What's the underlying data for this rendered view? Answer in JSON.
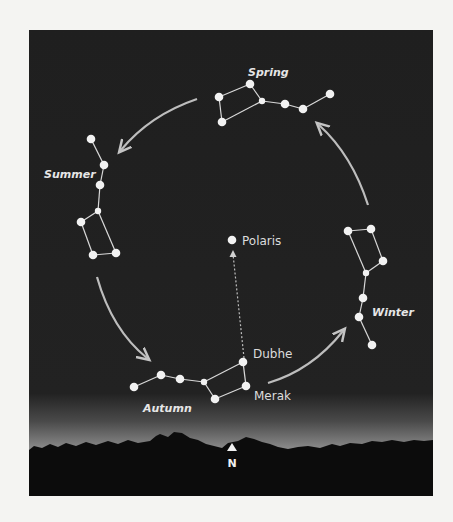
{
  "diagram": {
    "colors": {
      "page": "#f4f4f2",
      "sky": "#1f1f1f",
      "horizon_glow": "#8a8a8a",
      "trees": "#0c0c0c",
      "star": "#f2f2f2",
      "line": "#d8d8d8",
      "arrow": "#bdbdbd"
    },
    "seasons": [
      {
        "name": "Spring",
        "label": "Spring",
        "label_pos": [
          248,
          76
        ],
        "stars": [
          [
            219,
            97
          ],
          [
            250,
            84
          ],
          [
            262,
            101
          ],
          [
            285,
            104
          ],
          [
            303,
            109
          ],
          [
            330,
            94
          ],
          [
            222,
            122
          ]
        ],
        "lines": [
          [
            0,
            1
          ],
          [
            1,
            2
          ],
          [
            2,
            6
          ],
          [
            6,
            0
          ],
          [
            2,
            3
          ],
          [
            3,
            4
          ],
          [
            4,
            5
          ]
        ]
      },
      {
        "name": "Summer",
        "label": "Summer",
        "label_pos": [
          44,
          178
        ],
        "stars": [
          [
            91,
            139
          ],
          [
            104,
            165
          ],
          [
            100,
            185
          ],
          [
            98,
            211
          ],
          [
            81,
            222
          ],
          [
            93,
            255
          ],
          [
            116,
            253
          ]
        ],
        "lines": [
          [
            0,
            1
          ],
          [
            1,
            2
          ],
          [
            2,
            3
          ],
          [
            3,
            4
          ],
          [
            4,
            5
          ],
          [
            5,
            6
          ],
          [
            6,
            3
          ]
        ]
      },
      {
        "name": "Autumn",
        "label": "Autumn",
        "label_pos": [
          143,
          412
        ],
        "stars": [
          [
            134,
            387
          ],
          [
            161,
            375
          ],
          [
            180,
            379
          ],
          [
            204,
            382
          ],
          [
            215,
            399
          ],
          [
            243,
            362
          ],
          [
            246,
            386
          ]
        ],
        "lines": [
          [
            0,
            1
          ],
          [
            1,
            2
          ],
          [
            2,
            3
          ],
          [
            3,
            5
          ],
          [
            5,
            6
          ],
          [
            6,
            4
          ],
          [
            4,
            3
          ]
        ]
      },
      {
        "name": "Winter",
        "label": "Winter",
        "label_pos": [
          372,
          316
        ],
        "stars": [
          [
            348,
            231
          ],
          [
            371,
            229
          ],
          [
            383,
            261
          ],
          [
            366,
            273
          ],
          [
            363,
            298
          ],
          [
            359,
            317
          ],
          [
            372,
            345
          ]
        ],
        "lines": [
          [
            0,
            1
          ],
          [
            1,
            2
          ],
          [
            2,
            3
          ],
          [
            3,
            0
          ],
          [
            3,
            4
          ],
          [
            4,
            5
          ],
          [
            5,
            6
          ]
        ]
      }
    ],
    "named_stars": [
      {
        "name": "Polaris",
        "label": "Polaris",
        "pos": [
          232,
          240
        ],
        "label_pos": [
          242,
          245
        ]
      },
      {
        "name": "Dubhe",
        "label": "Dubhe",
        "pos": [
          243,
          362
        ],
        "label_pos": [
          253,
          358
        ]
      },
      {
        "name": "Merak",
        "label": "Merak",
        "pos": [
          246,
          386
        ],
        "label_pos": [
          254,
          400
        ]
      }
    ],
    "pointer_line": {
      "from": [
        244,
        358
      ],
      "to": [
        233,
        250
      ]
    },
    "arrows": [
      {
        "from_season": "Spring",
        "to_season": "Summer",
        "path": "M197,99 Q150,115 121,150"
      },
      {
        "from_season": "Summer",
        "to_season": "Autumn",
        "path": "M97,277 Q112,330 147,358"
      },
      {
        "from_season": "Autumn",
        "to_season": "Winter",
        "path": "M268,383 Q312,370 343,331"
      },
      {
        "from_season": "Winter",
        "to_season": "Spring",
        "path": "M368,205 Q352,155 319,125"
      }
    ],
    "north_marker": {
      "label": "N",
      "pos": [
        232,
        448
      ]
    }
  }
}
